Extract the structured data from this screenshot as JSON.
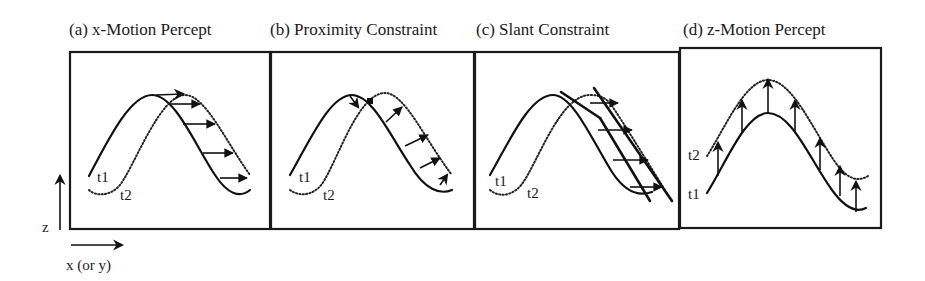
{
  "figure": {
    "panels": [
      {
        "id": "a",
        "title": "(a) x-Motion Percept",
        "curve_labels": {
          "t1": "t1",
          "t2": "t2"
        }
      },
      {
        "id": "b",
        "title": "(b) Proximity Constraint",
        "curve_labels": {
          "t1": "t1",
          "t2": "t2"
        }
      },
      {
        "id": "c",
        "title": "(c) Slant Constraint",
        "curve_labels": {
          "t1": "t1",
          "t2": "t2"
        }
      },
      {
        "id": "d",
        "title": "(d) z-Motion Percept",
        "curve_labels": {
          "t1": "t1",
          "t2": "t2"
        }
      }
    ],
    "axes": {
      "vertical_label": "z",
      "horizontal_label": "x (or y)"
    },
    "legend": {
      "solid_curve": "t1",
      "dotted_curve": "t2"
    }
  }
}
